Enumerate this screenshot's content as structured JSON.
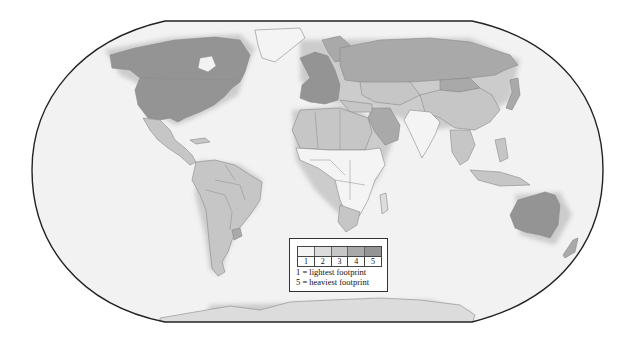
{
  "map": {
    "title": "",
    "projection": "Robinson-style world map",
    "colors": {
      "ocean": "#f2f2f2",
      "frame": "#222222",
      "level_1": "#f4f4f4",
      "level_2": "#dcdcdc",
      "level_3": "#c6c6c6",
      "level_4": "#a9a9a9",
      "level_5": "#949494"
    },
    "regions": [
      {
        "name": "North America (US, Canada)",
        "level": 5
      },
      {
        "name": "Greenland",
        "level": 1
      },
      {
        "name": "Mexico & Central America",
        "level": 3
      },
      {
        "name": "South America",
        "level": 3
      },
      {
        "name": "Uruguay",
        "level": 4
      },
      {
        "name": "Western Europe",
        "level": 5
      },
      {
        "name": "Russia",
        "level": 4
      },
      {
        "name": "Middle East / Saudi Arabia",
        "level": 4
      },
      {
        "name": "North Africa",
        "level": 3
      },
      {
        "name": "Sub-Saharan Africa",
        "level": 1
      },
      {
        "name": "South Africa",
        "level": 3
      },
      {
        "name": "China",
        "level": 3
      },
      {
        "name": "Mongolia",
        "level": 4
      },
      {
        "name": "India",
        "level": 1
      },
      {
        "name": "Japan",
        "level": 4
      },
      {
        "name": "Southeast Asia",
        "level": 3
      },
      {
        "name": "Australia",
        "level": 5
      },
      {
        "name": "New Zealand",
        "level": 4
      },
      {
        "name": "Antarctica",
        "level": 2
      }
    ]
  },
  "legend": {
    "scale": [
      "1",
      "2",
      "3",
      "4",
      "5"
    ],
    "line1": "1 = lightest footprint",
    "line2": "5 =  heaviest footprint"
  }
}
